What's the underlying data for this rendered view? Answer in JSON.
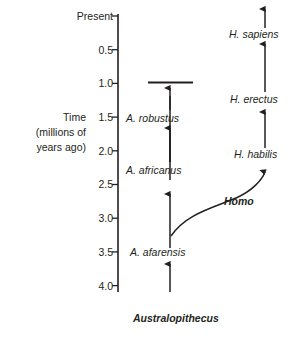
{
  "figure": {
    "type": "phylogenetic-tree",
    "stroke_color": "#231f20",
    "background_color": "#ffffff"
  },
  "axis": {
    "title_lines": [
      "Time",
      "(millions of",
      "years ago)"
    ],
    "tick_labels": [
      "Present",
      "0.5",
      "1.0",
      "1.5",
      "2.0",
      "2.5",
      "3.0",
      "3.5",
      "4.0"
    ],
    "tick_values": [
      0,
      0.5,
      1.0,
      1.5,
      2.0,
      2.5,
      3.0,
      3.5,
      4.0
    ],
    "unit": "millions of years ago",
    "direction": "present at top, oldest at bottom"
  },
  "lineages": {
    "australopithecus": {
      "genus_label": "Australopithecus",
      "species": [
        {
          "label": "A. afarensis",
          "age_mya": 3.5
        },
        {
          "label": "A. africanus",
          "age_mya": 2.5
        },
        {
          "label": "A. robustus",
          "age_mya": 1.5
        }
      ],
      "terminus": "extinct",
      "terminus_age_mya": 1.0
    },
    "homo": {
      "genus_label": "Homo",
      "species": [
        {
          "label": "H. habilis",
          "age_mya": 2.0
        },
        {
          "label": "H. erectus",
          "age_mya": 1.2
        },
        {
          "label": "H. sapiens",
          "age_mya": 0.3
        }
      ],
      "terminus": "extant",
      "terminus_age_mya": 0
    }
  },
  "branch": {
    "from_lineage": "australopithecus",
    "to_lineage": "homo",
    "divergence_age_mya": 3.0
  }
}
